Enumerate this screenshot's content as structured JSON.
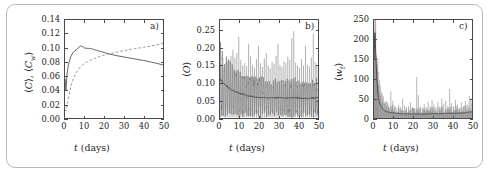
{
  "figure": {
    "panel_count": 3,
    "shared_xlabel": "t (days)"
  },
  "panels": [
    {
      "tag": "a)",
      "ylabel_plain": "⟨C⟩, ⟨Cw⟩",
      "xlabel": "t (days)",
      "yticks": [
        "0.00",
        "0.02",
        "0.04",
        "0.06",
        "0.08",
        "0.10",
        "0.12",
        "0.14"
      ],
      "xticks": [
        "0",
        "10",
        "20",
        "30",
        "40",
        "50"
      ]
    },
    {
      "tag": "b)",
      "ylabel_plain": "⟨O⟩",
      "xlabel": "t (days)",
      "yticks": [
        "0.00",
        "0.05",
        "0.10",
        "0.15",
        "0.20",
        "0.25"
      ],
      "xticks": [
        "0",
        "10",
        "20",
        "30",
        "40",
        "50"
      ]
    },
    {
      "tag": "c)",
      "ylabel_plain": "⟨wf⟩",
      "xlabel": "t (days)",
      "yticks": [
        "0",
        "50",
        "100",
        "150",
        "200",
        "250"
      ],
      "xticks": [
        "0",
        "10",
        "20",
        "30",
        "40",
        "50"
      ]
    }
  ],
  "chart_data": [
    {
      "type": "line",
      "panel": "a)",
      "title": "",
      "xlabel": "t (days)",
      "ylabel": "⟨C⟩, ⟨Cw⟩",
      "xlim": [
        0,
        50
      ],
      "ylim": [
        0.0,
        0.14
      ],
      "grid": false,
      "legend": "none",
      "xticks": [
        0,
        10,
        20,
        30,
        40,
        50
      ],
      "yticks": [
        0.0,
        0.02,
        0.04,
        0.06,
        0.08,
        0.1,
        0.12,
        0.14
      ],
      "series": [
        {
          "name": "⟨C⟩",
          "style": "solid",
          "color": "#555555",
          "x": [
            0,
            0.5,
            1,
            1.5,
            2,
            3,
            4,
            5,
            6,
            7,
            8,
            9,
            10,
            11,
            12,
            13,
            14,
            15,
            16,
            17,
            18,
            19,
            20,
            22,
            24,
            26,
            28,
            30,
            32,
            34,
            36,
            38,
            40,
            42,
            44,
            46,
            48,
            50
          ],
          "y": [
            0.056,
            0.04,
            0.062,
            0.072,
            0.079,
            0.088,
            0.093,
            0.096,
            0.098,
            0.101,
            0.103,
            0.102,
            0.1,
            0.0995,
            0.0995,
            0.0992,
            0.0985,
            0.0975,
            0.0968,
            0.096,
            0.0952,
            0.0944,
            0.0936,
            0.092,
            0.0905,
            0.0893,
            0.0882,
            0.0872,
            0.0862,
            0.0852,
            0.0842,
            0.0832,
            0.0822,
            0.081,
            0.0798,
            0.0786,
            0.0772,
            0.0758
          ]
        },
        {
          "name": "⟨Cw⟩",
          "style": "dashed",
          "color": "#8a8a8a",
          "x": [
            0,
            0.5,
            1,
            1.5,
            2,
            3,
            4,
            5,
            6,
            7,
            8,
            9,
            10,
            11,
            12,
            13,
            14,
            15,
            16,
            18,
            20,
            22,
            24,
            26,
            28,
            30,
            32,
            34,
            36,
            38,
            40,
            42,
            44,
            46,
            48,
            50
          ],
          "y": [
            0.012,
            0.01,
            0.016,
            0.024,
            0.032,
            0.045,
            0.054,
            0.061,
            0.066,
            0.07,
            0.0735,
            0.076,
            0.078,
            0.0798,
            0.0812,
            0.0825,
            0.0838,
            0.085,
            0.086,
            0.088,
            0.0898,
            0.0912,
            0.0925,
            0.0938,
            0.095,
            0.0962,
            0.0973,
            0.0983,
            0.0992,
            0.1,
            0.101,
            0.1018,
            0.1028,
            0.104,
            0.1052,
            0.1068
          ]
        }
      ]
    },
    {
      "type": "line",
      "panel": "b)",
      "title": "",
      "xlabel": "t (days)",
      "ylabel": "⟨O⟩",
      "xlim": [
        0,
        50
      ],
      "ylim": [
        0.0,
        0.28
      ],
      "grid": false,
      "legend": "none",
      "xticks": [
        0,
        10,
        20,
        30,
        40,
        50
      ],
      "yticks": [
        0.0,
        0.05,
        0.1,
        0.15,
        0.2,
        0.25
      ],
      "description": "High-frequency oscillating signal: baseline decays from ~0.11 to ~0.055 and stays near 0.055-0.065; daily oscillation amplitude large, with periodic tall spikes reaching 0.17-0.25 and troughs down to 0.00.",
      "baseline": {
        "x": [
          0,
          2,
          4,
          6,
          8,
          10,
          14,
          18,
          22,
          26,
          30,
          34,
          38,
          42,
          46,
          50
        ],
        "y": [
          0.112,
          0.098,
          0.088,
          0.08,
          0.074,
          0.07,
          0.064,
          0.06,
          0.058,
          0.057,
          0.058,
          0.057,
          0.058,
          0.056,
          0.056,
          0.058
        ]
      },
      "spikes": [
        {
          "x": 0.4,
          "y": 0.152
        },
        {
          "x": 1.4,
          "y": 0.146
        },
        {
          "x": 2.5,
          "y": 0.15
        },
        {
          "x": 3.6,
          "y": 0.16
        },
        {
          "x": 4.6,
          "y": 0.168
        },
        {
          "x": 5.6,
          "y": 0.178
        },
        {
          "x": 6.6,
          "y": 0.196
        },
        {
          "x": 7.6,
          "y": 0.172
        },
        {
          "x": 8.6,
          "y": 0.186
        },
        {
          "x": 9.6,
          "y": 0.232
        },
        {
          "x": 10.6,
          "y": 0.166
        },
        {
          "x": 11.6,
          "y": 0.15
        },
        {
          "x": 12.6,
          "y": 0.158
        },
        {
          "x": 13.6,
          "y": 0.148
        },
        {
          "x": 14.6,
          "y": 0.212
        },
        {
          "x": 15.6,
          "y": 0.176
        },
        {
          "x": 16.6,
          "y": 0.152
        },
        {
          "x": 17.6,
          "y": 0.144
        },
        {
          "x": 18.6,
          "y": 0.168
        },
        {
          "x": 19.6,
          "y": 0.206
        },
        {
          "x": 20.6,
          "y": 0.156
        },
        {
          "x": 21.6,
          "y": 0.146
        },
        {
          "x": 22.6,
          "y": 0.17
        },
        {
          "x": 23.6,
          "y": 0.186
        },
        {
          "x": 24.6,
          "y": 0.15
        },
        {
          "x": 25.6,
          "y": 0.142
        },
        {
          "x": 26.6,
          "y": 0.16
        },
        {
          "x": 27.6,
          "y": 0.154
        },
        {
          "x": 28.6,
          "y": 0.178
        },
        {
          "x": 29.6,
          "y": 0.212
        },
        {
          "x": 30.6,
          "y": 0.152
        },
        {
          "x": 31.6,
          "y": 0.146
        },
        {
          "x": 32.6,
          "y": 0.162
        },
        {
          "x": 33.6,
          "y": 0.158
        },
        {
          "x": 34.6,
          "y": 0.176
        },
        {
          "x": 35.6,
          "y": 0.166
        },
        {
          "x": 36.6,
          "y": 0.228
        },
        {
          "x": 37.6,
          "y": 0.248
        },
        {
          "x": 38.6,
          "y": 0.158
        },
        {
          "x": 39.6,
          "y": 0.15
        },
        {
          "x": 40.6,
          "y": 0.144
        },
        {
          "x": 41.6,
          "y": 0.168
        },
        {
          "x": 42.6,
          "y": 0.15
        },
        {
          "x": 43.6,
          "y": 0.206
        },
        {
          "x": 44.6,
          "y": 0.152
        },
        {
          "x": 45.6,
          "y": 0.146
        },
        {
          "x": 46.6,
          "y": 0.172
        },
        {
          "x": 47.6,
          "y": 0.24
        },
        {
          "x": 48.6,
          "y": 0.158
        },
        {
          "x": 49.4,
          "y": 0.148
        }
      ]
    },
    {
      "type": "line",
      "panel": "c)",
      "title": "",
      "xlabel": "t (days)",
      "ylabel": "⟨wf⟩",
      "xlim": [
        0,
        50
      ],
      "ylim": [
        0,
        250
      ],
      "grid": false,
      "legend": "none",
      "xticks": [
        0,
        10,
        20,
        30,
        40,
        50
      ],
      "yticks": [
        0,
        50,
        100,
        150,
        200,
        250
      ],
      "description": "Sharp initial peak near 220 at t≈0.5, rapid decay to a low baseline (~10-20) by day 5, then persistent small spikes; a prominent spike of ~105 near day 22 and moderate spikes 40-75 scattered through days 8-50.",
      "baseline": {
        "x": [
          0,
          0.5,
          1,
          1.5,
          2,
          2.5,
          3,
          4,
          5,
          6,
          8,
          10,
          14,
          18,
          22,
          26,
          30,
          34,
          38,
          42,
          46,
          50
        ],
        "y": [
          150,
          220,
          150,
          95,
          62,
          45,
          36,
          26,
          20,
          17,
          14,
          13,
          11,
          10,
          10,
          10,
          11,
          11,
          12,
          12,
          13,
          16
        ]
      },
      "spikes": [
        {
          "x": 0.2,
          "y": 208
        },
        {
          "x": 0.6,
          "y": 222
        },
        {
          "x": 1.2,
          "y": 160
        },
        {
          "x": 1.8,
          "y": 120
        },
        {
          "x": 2.4,
          "y": 86
        },
        {
          "x": 3.2,
          "y": 58
        },
        {
          "x": 4.2,
          "y": 44
        },
        {
          "x": 5.2,
          "y": 36
        },
        {
          "x": 6.4,
          "y": 32
        },
        {
          "x": 7.4,
          "y": 30
        },
        {
          "x": 8.6,
          "y": 68
        },
        {
          "x": 9.6,
          "y": 44
        },
        {
          "x": 10.6,
          "y": 30
        },
        {
          "x": 11.6,
          "y": 26
        },
        {
          "x": 12.6,
          "y": 34
        },
        {
          "x": 13.6,
          "y": 28
        },
        {
          "x": 14.6,
          "y": 50
        },
        {
          "x": 15.6,
          "y": 32
        },
        {
          "x": 16.6,
          "y": 26
        },
        {
          "x": 17.6,
          "y": 30
        },
        {
          "x": 18.6,
          "y": 40
        },
        {
          "x": 19.6,
          "y": 28
        },
        {
          "x": 20.6,
          "y": 24
        },
        {
          "x": 21.8,
          "y": 105
        },
        {
          "x": 22.6,
          "y": 58
        },
        {
          "x": 23.6,
          "y": 30
        },
        {
          "x": 24.6,
          "y": 26
        },
        {
          "x": 25.6,
          "y": 36
        },
        {
          "x": 26.6,
          "y": 28
        },
        {
          "x": 27.6,
          "y": 42
        },
        {
          "x": 28.6,
          "y": 30
        },
        {
          "x": 29.6,
          "y": 46
        },
        {
          "x": 30.6,
          "y": 34
        },
        {
          "x": 31.6,
          "y": 28
        },
        {
          "x": 32.6,
          "y": 40
        },
        {
          "x": 33.6,
          "y": 30
        },
        {
          "x": 34.6,
          "y": 50
        },
        {
          "x": 35.6,
          "y": 36
        },
        {
          "x": 36.6,
          "y": 44
        },
        {
          "x": 37.6,
          "y": 30
        },
        {
          "x": 38.6,
          "y": 74
        },
        {
          "x": 39.6,
          "y": 38
        },
        {
          "x": 40.6,
          "y": 28
        },
        {
          "x": 41.6,
          "y": 46
        },
        {
          "x": 42.6,
          "y": 34
        },
        {
          "x": 43.6,
          "y": 26
        },
        {
          "x": 44.6,
          "y": 40
        },
        {
          "x": 45.6,
          "y": 30
        },
        {
          "x": 46.6,
          "y": 44
        },
        {
          "x": 47.6,
          "y": 34
        },
        {
          "x": 48.6,
          "y": 56
        },
        {
          "x": 49.5,
          "y": 50
        }
      ]
    }
  ]
}
